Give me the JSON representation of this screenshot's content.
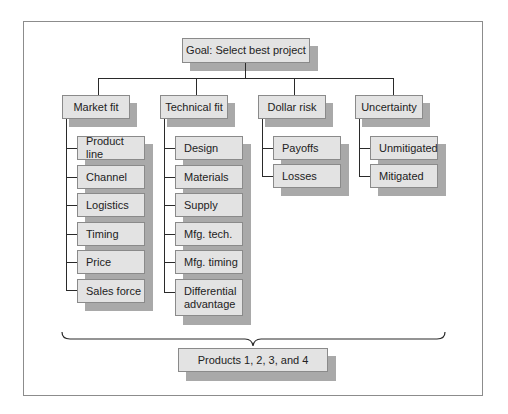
{
  "goal": {
    "label": "Goal: Select best project"
  },
  "criteria": [
    {
      "label": "Market fit",
      "subcriteria": [
        "Product line",
        "Channel",
        "Logistics",
        "Timing",
        "Price",
        "Sales force"
      ]
    },
    {
      "label": "Technical fit",
      "subcriteria": [
        "Design",
        "Materials",
        "Supply",
        "Mfg. tech.",
        "Mfg. timing",
        "Differential advantage"
      ]
    },
    {
      "label": "Dollar risk",
      "subcriteria": [
        "Payoffs",
        "Losses"
      ]
    },
    {
      "label": "Uncertainty",
      "subcriteria": [
        "Unmitigated",
        "Mitigated"
      ]
    }
  ],
  "alternatives": {
    "label": "Products 1, 2, 3, and 4"
  },
  "colors": {
    "box_fill": "#e3e3e3",
    "box_border": "#8a8a8a",
    "shadow": "#a9a9a9",
    "connector": "#2a2a2a",
    "frame_border": "#8c8c8c"
  }
}
